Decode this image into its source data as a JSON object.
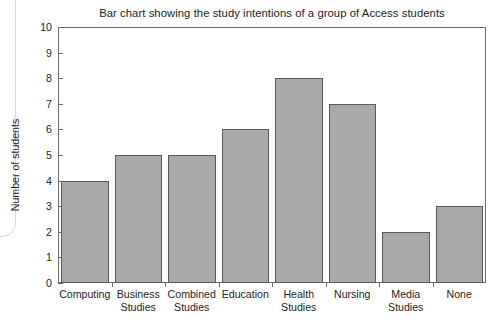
{
  "chart_data": {
    "type": "bar",
    "title": "Bar chart showing the study intentions of a group of Access students",
    "xlabel": "",
    "ylabel": "Number of students",
    "categories": [
      "Computing",
      "Business Studies",
      "Combined Studies",
      "Education",
      "Health Studies",
      "Nursing",
      "Media Studies",
      "None"
    ],
    "values": [
      4,
      5,
      5,
      6,
      8,
      7,
      2,
      3
    ],
    "ylim": [
      0,
      10
    ],
    "ytick_labels": [
      "10",
      "9",
      "8",
      "7",
      "6",
      "5",
      "4",
      "3",
      "2",
      "1",
      "0"
    ],
    "ytick_values": [
      10,
      9,
      8,
      7,
      6,
      5,
      4,
      3,
      2,
      1,
      0
    ],
    "grid": false,
    "legend": null,
    "bar_color": "#a9a9a9",
    "bar_border_color": "#5a5a5a",
    "axis_color": "#6b6b6b",
    "background": "#ffffff"
  }
}
